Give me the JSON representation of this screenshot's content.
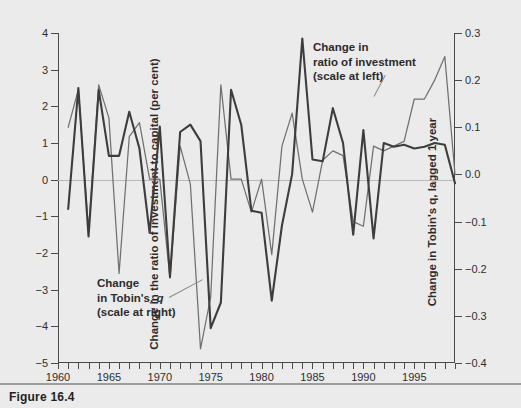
{
  "figure": {
    "caption": "Figure 16.4"
  },
  "chart_data": {
    "type": "line",
    "title": "",
    "xlabel": "",
    "grid": false,
    "legend_position": "inline-annotations",
    "xlim": [
      1960,
      1999
    ],
    "x_tick_labels": [
      "1960",
      "1965",
      "1970",
      "1975",
      "1980",
      "1985",
      "1990",
      "1995"
    ],
    "x_tick_values": [
      1960,
      1965,
      1970,
      1975,
      1980,
      1985,
      1990,
      1995
    ],
    "x_minor_tick_step": 1,
    "left_axis": {
      "label": "Change in the ratio of investment to capital (per cent)",
      "ylim": [
        -5,
        4
      ],
      "ticks": [
        4,
        3,
        2,
        1,
        0,
        -1,
        -2,
        -3,
        -4,
        -5
      ],
      "tick_labels": [
        "4",
        "3",
        "2",
        "1",
        "0",
        "−1",
        "−2",
        "−3",
        "−4",
        "−5"
      ]
    },
    "right_axis": {
      "label": "Change in Tobin's q, lagged 1 year",
      "ylim": [
        -0.4,
        0.3
      ],
      "ticks": [
        0.3,
        0.2,
        0.1,
        0.0,
        -0.1,
        -0.2,
        -0.3,
        -0.4
      ],
      "tick_labels": [
        "0.3",
        "0.2",
        "0.1",
        "0.0",
        "−0.1",
        "−0.2",
        "−0.3",
        "−0.4"
      ]
    },
    "annotations": [
      {
        "name": "investment-series-label",
        "lines": [
          "Change in",
          "ratio of investment",
          "(scale at left)"
        ],
        "note": "scale at left"
      },
      {
        "name": "tobins-q-series-label",
        "lines": [
          "Change",
          "in Tobin's, q",
          "(scale at right)"
        ],
        "note": "scale at right"
      }
    ],
    "series": [
      {
        "name": "Change in ratio of investment",
        "axis": "left",
        "color": "#3d3d3d",
        "x": [
          1961,
          1962,
          1963,
          1964,
          1965,
          1966,
          1967,
          1968,
          1969,
          1970,
          1971,
          1972,
          1973,
          1974,
          1975,
          1976,
          1977,
          1978,
          1979,
          1980,
          1981,
          1982,
          1983,
          1984,
          1985,
          1986,
          1987,
          1988,
          1989,
          1990,
          1991,
          1992,
          1993,
          1994,
          1995,
          1996,
          1997,
          1998,
          1999
        ],
        "values": [
          -0.8,
          2.5,
          -1.55,
          2.45,
          0.65,
          0.65,
          1.85,
          0.85,
          -1.45,
          1.45,
          -2.65,
          1.3,
          1.5,
          1.05,
          -4.05,
          -3.35,
          2.45,
          1.5,
          -0.85,
          -0.9,
          -3.3,
          -1.25,
          0.15,
          3.85,
          0.55,
          0.5,
          1.95,
          1.0,
          -1.5,
          1.35,
          -1.6,
          1.0,
          0.9,
          0.95,
          0.85,
          0.9,
          1.0,
          0.95,
          -0.1
        ]
      },
      {
        "name": "Change in Tobin's q, lagged 1 year",
        "axis": "right",
        "color": "#707070",
        "x": [
          1961,
          1962,
          1963,
          1964,
          1965,
          1966,
          1967,
          1968,
          1969,
          1970,
          1971,
          1972,
          1973,
          1974,
          1975,
          1976,
          1977,
          1978,
          1979,
          1980,
          1981,
          1982,
          1983,
          1984,
          1985,
          1986,
          1987,
          1988,
          1989,
          1990,
          1991,
          1992,
          1993,
          1994,
          1995,
          1996,
          1997,
          1998,
          1999
        ],
        "values": [
          0.1,
          0.18,
          -0.12,
          0.19,
          0.12,
          -0.21,
          0.08,
          0.11,
          -0.01,
          -0.01,
          -0.22,
          0.06,
          -0.02,
          -0.37,
          -0.26,
          0.19,
          -0.01,
          -0.01,
          -0.08,
          -0.01,
          -0.17,
          0.06,
          0.13,
          -0.01,
          -0.08,
          0.03,
          0.05,
          0.04,
          -0.1,
          -0.11,
          0.06,
          0.05,
          0.06,
          0.07,
          0.16,
          0.16,
          0.2,
          0.25,
          0.0
        ]
      }
    ]
  }
}
